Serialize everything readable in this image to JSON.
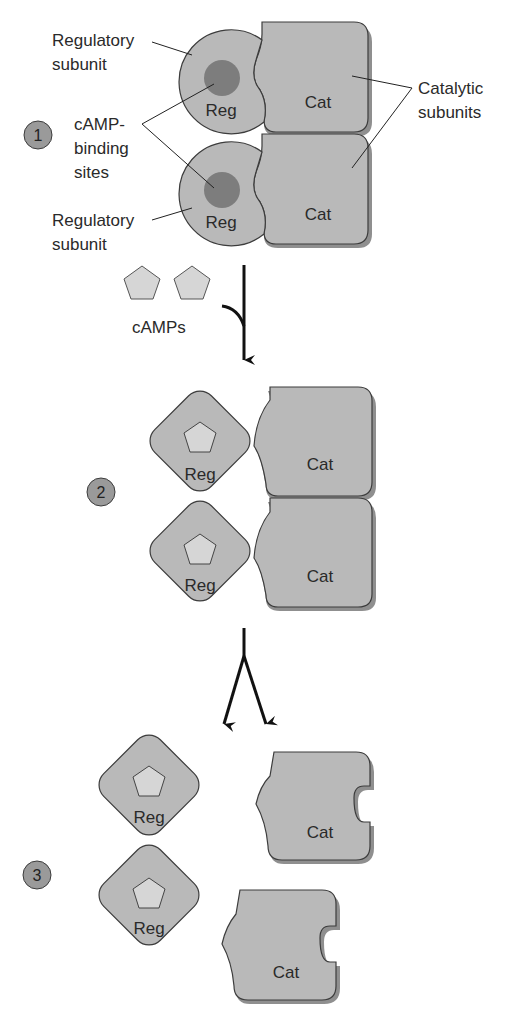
{
  "colors": {
    "subunit_fill": "#b9b9b9",
    "subunit_shadow": "#8f8f8f",
    "outline": "#3c3c3c",
    "binding_site": "#7d7d7d",
    "camp_fill": "#d6d6d6",
    "step_badge": "#9a9a9a",
    "arrow": "#111111"
  },
  "steps": [
    {
      "number": "1",
      "reg_label": "Reg",
      "cat_label": "Cat",
      "labels": {
        "regulatory_top": [
          "Regulatory",
          "subunit"
        ],
        "regulatory_bottom": [
          "Regulatory",
          "subunit"
        ],
        "binding_sites": [
          "cAMP-",
          "binding",
          "sites"
        ],
        "catalytic": [
          "Catalytic",
          "subunits"
        ]
      }
    },
    {
      "number": "2",
      "reg_label": "Reg",
      "cat_label": "Cat"
    },
    {
      "number": "3",
      "reg_label": "Reg",
      "cat_label": "Cat"
    }
  ],
  "camp_label": "cAMPs"
}
